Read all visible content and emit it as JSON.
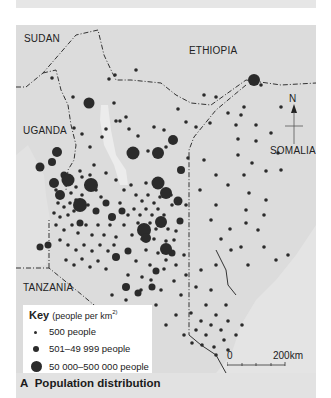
{
  "map": {
    "countries": {
      "sudan": "SUDAN",
      "ethiopia": "ETHIOPIA",
      "uganda": "UGANDA",
      "somalia": "SOMALIA",
      "tanzania": "TANZANIA"
    },
    "north_label": "N",
    "scale": {
      "start": "0",
      "end": "200",
      "unit": "km"
    },
    "colors": {
      "background": "#dcdcdc",
      "land": "#d2d2d2",
      "sea": "#e4e4e4",
      "dots": "#2b2b2b",
      "borders": "#333333"
    }
  },
  "key": {
    "title": "Key",
    "subtitle": "(people per km",
    "superscript": "2)",
    "items": [
      {
        "label": "500 people",
        "size": 3
      },
      {
        "label": "501–49 999 people",
        "size": 6
      },
      {
        "label": "50 000–500 000 people",
        "size": 11
      },
      {
        "label": "over 500 000 people",
        "size": 15
      }
    ]
  },
  "caption": {
    "letter": "A",
    "text": "Population distribution"
  }
}
